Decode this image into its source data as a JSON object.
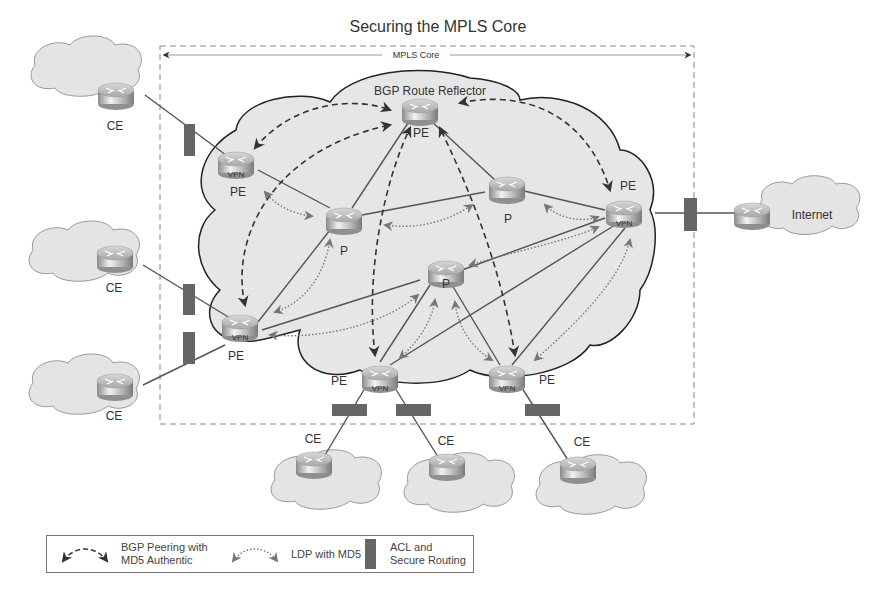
{
  "title": "Securing the MPLS Core",
  "core_frame": {
    "label": "MPLS Core"
  },
  "core_cloud": {
    "label": "BGP Route Reflector"
  },
  "colors": {
    "cloud_fill": "#e6e6e6",
    "cloud_stroke": "#222222",
    "frame_dash": "#888888",
    "acl_block": "#666666",
    "link": "#555555",
    "bgp_arrow": "#333333",
    "ldp_arrow": "#777777"
  },
  "nodes": {
    "rr": {
      "label": "PE",
      "sub": ""
    },
    "pe_top_left": {
      "label": "PE",
      "sub": "VPN"
    },
    "pe_left": {
      "label": "PE",
      "sub": "VPN"
    },
    "pe_right": {
      "label": "PE",
      "sub": "VPN"
    },
    "pe_bottom_mid": {
      "label": "PE",
      "sub": "VPN"
    },
    "pe_bottom_right": {
      "label": "PE",
      "sub": "VPN"
    },
    "p_left": {
      "label": "P"
    },
    "p_right": {
      "label": "P"
    },
    "p_center": {
      "label": "P"
    },
    "ce_1": {
      "label": "CE"
    },
    "ce_2": {
      "label": "CE"
    },
    "ce_3": {
      "label": "CE"
    },
    "ce_4": {
      "label": "CE"
    },
    "ce_5": {
      "label": "CE"
    },
    "ce_6": {
      "label": "CE"
    },
    "internet": {
      "label": "Internet"
    }
  },
  "legend": {
    "bgp": "BGP Peering with\nMD5 Authentic",
    "ldp": "LDP with MD5",
    "acl": "ACL and\nSecure Routing"
  }
}
